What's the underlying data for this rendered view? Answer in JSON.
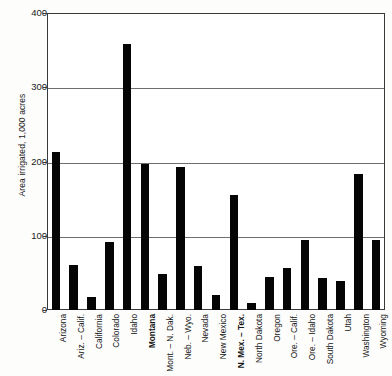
{
  "chart_data": {
    "type": "bar",
    "title": "",
    "subtitle": "",
    "xlabel": "",
    "ylabel": "Area irrigated, 1,000 acres",
    "ylim": [
      0,
      400
    ],
    "yticks": [
      0,
      100,
      200,
      300,
      400
    ],
    "ytick_labels": [
      "0",
      "100",
      "200",
      "300",
      "400"
    ],
    "grid": true,
    "legend": "none",
    "bar_color": "#050505",
    "categories": [
      "Arizona",
      "Ariz. – Calif.",
      "California",
      "Colorado",
      "Idaho",
      "Montana",
      "Mont. – N. Dak.",
      "Neb. – Wyo.",
      "Nevada",
      "New Mexico",
      "N. Mex. – Tex.",
      "North Dakota",
      "Oregon",
      "Ore. – Calif.",
      "Ore. – Idaho",
      "South Dakota",
      "Utah",
      "Washington",
      "Wyoming"
    ],
    "values": [
      213,
      60,
      17,
      92,
      358,
      197,
      49,
      193,
      59,
      20,
      155,
      10,
      44,
      57,
      94,
      43,
      39,
      183,
      94
    ],
    "emphasized_categories": [
      "Montana",
      "N. Mex. – Tex."
    ]
  },
  "axis": {
    "y_title": "Area irrigated, 1,000 acres"
  }
}
